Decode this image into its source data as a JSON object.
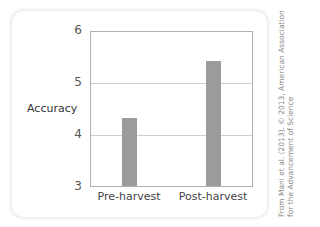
{
  "chart_data": {
    "type": "bar",
    "title": "",
    "xlabel": "",
    "ylabel": "Accuracy",
    "categories": [
      "Pre-harvest",
      "Post-harvest"
    ],
    "values": [
      4.32,
      5.43
    ],
    "ylim": [
      3,
      6
    ],
    "yticks": [
      "6",
      "5",
      "4",
      "3"
    ],
    "grid": true,
    "bar_color": "#9b9b9b"
  },
  "credit": {
    "line1": "From Mani et al. (2013). © 2013, American Association",
    "line2": "for the Advancement of Science"
  }
}
